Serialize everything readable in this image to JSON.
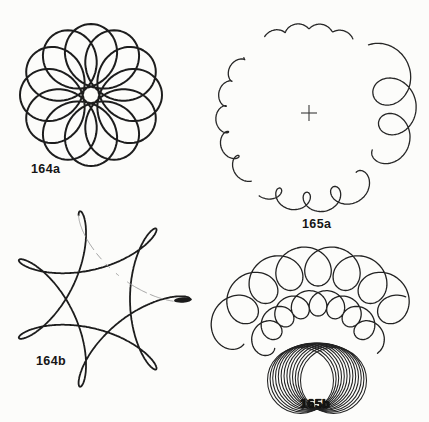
{
  "page": {
    "background": "#fcfcfa",
    "ink": "#1d1d1d",
    "width": 429,
    "height": 422
  },
  "labels": [
    {
      "text": "164a"
    },
    {
      "text": "165a"
    },
    {
      "text": "164b"
    },
    {
      "text": "165b"
    }
  ],
  "curves": [
    {
      "type": "hypotrochoid",
      "name": "rose-curve-164a",
      "cx": 91,
      "cy": 95,
      "a": 39.5,
      "b": 31.5,
      "q": 11,
      "segments": [
        {
          "from": 0,
          "to": 360,
          "stroke": "#1d1d1d",
          "width": 2.0
        }
      ]
    },
    {
      "type": "hypotrochoid",
      "name": "star-curve-164b",
      "cx": 100,
      "cy": 299,
      "a": 60,
      "b": 30,
      "q": 2.5,
      "segments": [
        {
          "from": 0,
          "to": 627,
          "stroke": "#1d1d1d",
          "width": 1.8
        },
        {
          "from": 627,
          "to": 713,
          "stroke": "#9b9b9b",
          "width": 0.9,
          "dash": "22 4 12 5 7 7 5 9 3 11"
        }
      ]
    },
    {
      "type": "blob",
      "name": "ink-blob-164b-right-tip",
      "cx": 183,
      "cy": 300,
      "rx": 9,
      "ry": 2.7,
      "rot": -4,
      "fill": "#1a1a1a"
    },
    {
      "type": "epitrochoid",
      "name": "growing-loop-circle-165a",
      "cx": 309,
      "cy": 114,
      "A": 88,
      "d0": 2.2,
      "d1": 24,
      "dexp": true,
      "k0": 24,
      "k1": 16,
      "deg0": -61,
      "deg1": -394,
      "loopAt": -90,
      "gaps": [
        [
          0.171,
          0.228
        ],
        [
          0.492,
          0.534
        ],
        [
          0.748,
          0.812
        ]
      ],
      "stroke": "#262626",
      "width": 1.3
    },
    {
      "type": "cross",
      "name": "center-cross-165a",
      "cx": 309,
      "cy": 113,
      "r": 8,
      "stroke": "#3a3a3a",
      "width": 1.1
    },
    {
      "type": "epitrochoid",
      "name": "outer-loop-arc-165b",
      "cx": 318,
      "cy": 361,
      "A": 95,
      "d0": 20,
      "d1": 20,
      "dexp": false,
      "k0": 20.5,
      "k1": 20.5,
      "deg0": -163,
      "deg1": -28,
      "loopAt": -90,
      "gaps": [],
      "stroke": "#222222",
      "width": 1.3
    },
    {
      "type": "epitrochoid",
      "name": "inner-loop-arc-165b",
      "cx": 318,
      "cy": 361,
      "A": 58,
      "d0": 13,
      "d1": 13,
      "dexp": false,
      "k0": 20.25,
      "k1": 20.25,
      "deg0": -165,
      "deg1": -20,
      "loopAt": -90,
      "gaps": [],
      "stroke": "#222222",
      "width": 1.3
    },
    {
      "type": "circlefan",
      "name": "circle-fan-165b",
      "px": 317,
      "py": 409,
      "rho": 33,
      "phi0": -30,
      "phi1": 30,
      "n": 13,
      "stroke": "#222222",
      "width": 1.05
    }
  ]
}
